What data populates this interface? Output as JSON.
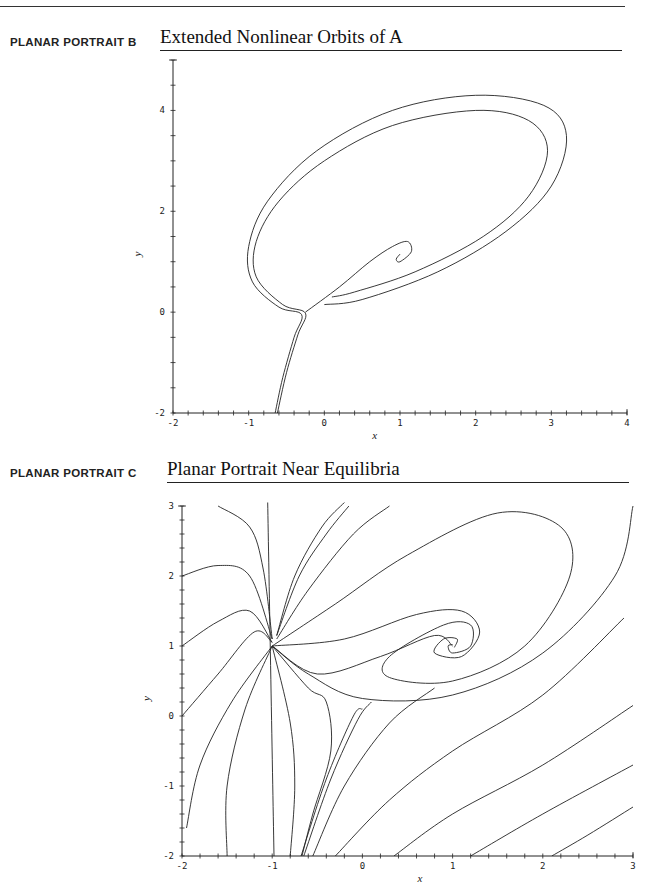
{
  "page": {
    "sections": [
      {
        "label": "PLANAR PORTRAIT B",
        "title": "Extended Nonlinear Orbits of A"
      },
      {
        "label": "PLANAR PORTRAIT C",
        "title": "Planar Portrait Near Equilibria"
      }
    ]
  },
  "chart_data": [
    {
      "type": "line",
      "title": "Extended Nonlinear Orbits of A",
      "xlabel": "x",
      "ylabel": "y",
      "xlim": [
        -2,
        4
      ],
      "ylim": [
        -2,
        5
      ],
      "xticks": [
        -2,
        -1,
        0,
        1,
        2,
        3,
        4
      ],
      "yticks": [
        -2,
        0,
        2,
        4
      ],
      "grid": false,
      "pixel_frame": {
        "x0": 173,
        "x1": 627,
        "y0": 413,
        "y1": 60
      },
      "series": [
        {
          "name": "outer orbit",
          "points": [
            [
              -0.65,
              -2
            ],
            [
              -0.55,
              -1.3
            ],
            [
              -0.4,
              -0.5
            ],
            [
              -0.3,
              -0.05
            ],
            [
              -0.6,
              0.1
            ],
            [
              -0.95,
              0.6
            ],
            [
              -1.0,
              1.3
            ],
            [
              -0.75,
              2.2
            ],
            [
              -0.1,
              3.2
            ],
            [
              0.9,
              4.0
            ],
            [
              2.0,
              4.3
            ],
            [
              2.9,
              4.1
            ],
            [
              3.2,
              3.5
            ],
            [
              3.0,
              2.5
            ],
            [
              2.4,
              1.6
            ],
            [
              1.5,
              0.8
            ],
            [
              0.5,
              0.25
            ],
            [
              0,
              0.15
            ]
          ]
        },
        {
          "name": "inner orbit",
          "points": [
            [
              -0.62,
              -2
            ],
            [
              -0.5,
              -1.2
            ],
            [
              -0.35,
              -0.45
            ],
            [
              -0.25,
              -0.02
            ],
            [
              -0.55,
              0.15
            ],
            [
              -0.9,
              0.7
            ],
            [
              -0.9,
              1.4
            ],
            [
              -0.6,
              2.2
            ],
            [
              0,
              3.0
            ],
            [
              0.9,
              3.7
            ],
            [
              2.0,
              4.0
            ],
            [
              2.7,
              3.8
            ],
            [
              2.95,
              3.2
            ],
            [
              2.7,
              2.3
            ],
            [
              2.1,
              1.5
            ],
            [
              1.2,
              0.8
            ],
            [
              0.4,
              0.4
            ],
            [
              0.1,
              0.3
            ]
          ]
        },
        {
          "name": "spiral",
          "points": [
            [
              -0.25,
              0.0
            ],
            [
              0.2,
              0.5
            ],
            [
              0.6,
              1.0
            ],
            [
              0.9,
              1.3
            ],
            [
              1.1,
              1.4
            ],
            [
              1.15,
              1.2
            ],
            [
              1.0,
              1.0
            ],
            [
              0.95,
              1.05
            ],
            [
              1.0,
              1.15
            ]
          ]
        }
      ]
    },
    {
      "type": "line",
      "title": "Planar Portrait Near Equilibria",
      "xlabel": "x",
      "ylabel": "y",
      "xlim": [
        -2,
        3
      ],
      "ylim": [
        -2,
        3
      ],
      "xticks": [
        -2,
        -1,
        0,
        1,
        2,
        3
      ],
      "yticks": [
        -2,
        -1,
        0,
        1,
        2,
        3
      ],
      "grid": false,
      "equilibria": [
        [
          -1,
          1
        ],
        [
          0,
          0.1
        ],
        [
          1,
          1
        ]
      ],
      "pixel_frame": {
        "x0": 182,
        "x1": 633,
        "y0": 856,
        "y1": 506
      },
      "series": [
        {
          "name": "vertical line",
          "points": [
            [
              -1.05,
              3.05
            ],
            [
              -0.98,
              -2
            ]
          ]
        },
        {
          "name": "c1",
          "points": [
            [
              -1.6,
              3.0
            ],
            [
              -1.25,
              2.7
            ],
            [
              -1.1,
              2.1
            ],
            [
              -1.0,
              1.1
            ]
          ]
        },
        {
          "name": "c2",
          "points": [
            [
              -2,
              2.0
            ],
            [
              -1.6,
              2.15
            ],
            [
              -1.25,
              2.0
            ],
            [
              -1.0,
              1.1
            ]
          ]
        },
        {
          "name": "c3",
          "points": [
            [
              -2,
              1.0
            ],
            [
              -1.6,
              1.35
            ],
            [
              -1.25,
              1.5
            ],
            [
              -1.0,
              1.05
            ]
          ]
        },
        {
          "name": "c4",
          "points": [
            [
              -2,
              0
            ],
            [
              -1.6,
              0.6
            ],
            [
              -1.2,
              1.2
            ],
            [
              -1.0,
              1.05
            ]
          ]
        },
        {
          "name": "c5",
          "points": [
            [
              -1.95,
              -1.6
            ],
            [
              -1.8,
              -0.7
            ],
            [
              -1.45,
              0.2
            ],
            [
              -1.0,
              1.0
            ]
          ]
        },
        {
          "name": "c6",
          "points": [
            [
              -1.5,
              -2
            ],
            [
              -1.5,
              -1.0
            ],
            [
              -1.3,
              0.1
            ],
            [
              -1.0,
              1.0
            ]
          ]
        },
        {
          "name": "c7",
          "points": [
            [
              -0.8,
              -2
            ],
            [
              -0.75,
              -1.0
            ],
            [
              -0.8,
              -0.1
            ],
            [
              -1.0,
              1.0
            ]
          ]
        },
        {
          "name": "c8",
          "points": [
            [
              -1.0,
              1.0
            ],
            [
              -0.6,
              0.4
            ],
            [
              -0.4,
              0.2
            ],
            [
              -0.35,
              -0.5
            ],
            [
              -0.55,
              -1.4
            ],
            [
              -0.67,
              -2
            ]
          ]
        },
        {
          "name": "sep1",
          "points": [
            [
              -0.68,
              -2
            ],
            [
              -0.4,
              -0.9
            ],
            [
              -0.1,
              0.0
            ],
            [
              0,
              0.1
            ]
          ]
        },
        {
          "name": "sep2",
          "points": [
            [
              -0.65,
              -2
            ],
            [
              -0.35,
              -0.9
            ],
            [
              -0.05,
              -0.05
            ],
            [
              0.1,
              0.2
            ]
          ]
        },
        {
          "name": "c9",
          "points": [
            [
              -0.55,
              -2
            ],
            [
              -0.2,
              -1.0
            ],
            [
              0.3,
              -0.1
            ],
            [
              0.8,
              0.4
            ]
          ]
        },
        {
          "name": "c10",
          "points": [
            [
              -0.3,
              -2
            ],
            [
              0.3,
              -1.2
            ],
            [
              1.0,
              -0.5
            ],
            [
              2.0,
              0.3
            ],
            [
              2.9,
              1.4
            ]
          ]
        },
        {
          "name": "c11",
          "points": [
            [
              0.35,
              -2
            ],
            [
              1.0,
              -1.4
            ],
            [
              2.0,
              -0.7
            ],
            [
              3.0,
              0.15
            ]
          ]
        },
        {
          "name": "c12",
          "points": [
            [
              1.2,
              -2
            ],
            [
              2.0,
              -1.4
            ],
            [
              3.0,
              -0.7
            ]
          ]
        },
        {
          "name": "c13",
          "points": [
            [
              2.1,
              -2
            ],
            [
              2.5,
              -1.7
            ],
            [
              3.0,
              -1.3
            ]
          ]
        },
        {
          "name": "c14",
          "points": [
            [
              -0.95,
              1.15
            ],
            [
              -0.7,
              2.0
            ],
            [
              -0.4,
              2.6
            ],
            [
              -0.15,
              3.0
            ]
          ]
        },
        {
          "name": "c15",
          "points": [
            [
              -0.95,
              1.15
            ],
            [
              -0.75,
              2.0
            ],
            [
              -0.45,
              2.7
            ],
            [
              -0.2,
              3.05
            ]
          ]
        },
        {
          "name": "c16",
          "points": [
            [
              -0.95,
              1.1
            ],
            [
              -0.6,
              1.8
            ],
            [
              -0.1,
              2.6
            ],
            [
              0.3,
              3.0
            ]
          ]
        },
        {
          "name": "c17",
          "points": [
            [
              -1.0,
              1.0
            ],
            [
              -0.6,
              0.6
            ],
            [
              0.0,
              0.25
            ],
            [
              1.0,
              0.3
            ],
            [
              2.0,
              0.9
            ],
            [
              2.8,
              2.0
            ],
            [
              3.0,
              3.0
            ]
          ]
        },
        {
          "name": "outer spiral",
          "points": [
            [
              -1.0,
              1.0
            ],
            [
              -0.3,
              1.6
            ],
            [
              0.5,
              2.3
            ],
            [
              1.5,
              2.9
            ],
            [
              2.2,
              2.7
            ],
            [
              2.3,
              2.0
            ],
            [
              1.8,
              1.0
            ],
            [
              1.0,
              0.5
            ],
            [
              0.3,
              0.55
            ],
            [
              0.3,
              0.85
            ],
            [
              0.9,
              1.3
            ],
            [
              1.2,
              1.3
            ],
            [
              1.2,
              1.0
            ],
            [
              1.0,
              0.9
            ],
            [
              0.95,
              1.0
            ],
            [
              1.0,
              1.02
            ]
          ]
        },
        {
          "name": "inner spiral",
          "points": [
            [
              -1.0,
              1.0
            ],
            [
              -0.2,
              1.1
            ],
            [
              0.6,
              1.45
            ],
            [
              1.1,
              1.5
            ],
            [
              1.3,
              1.2
            ],
            [
              1.1,
              0.85
            ],
            [
              0.8,
              0.9
            ],
            [
              0.9,
              1.1
            ],
            [
              1.05,
              1.1
            ],
            [
              1.02,
              0.98
            ]
          ]
        },
        {
          "name": "c18",
          "points": [
            [
              -1.0,
              1.0
            ],
            [
              -0.5,
              0.6
            ],
            [
              0.2,
              0.85
            ],
            [
              0.8,
              1.15
            ],
            [
              1.0,
              1.0
            ]
          ]
        }
      ]
    }
  ]
}
